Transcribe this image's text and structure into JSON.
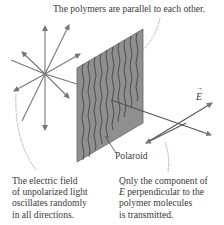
{
  "diagram": {
    "labels": {
      "top": "The polymers are parallel to each other.",
      "polaroid": "Polaroid",
      "field_vector": "E",
      "left_caption": [
        "The electric field",
        "of unpolarized light",
        "oscillates randomly",
        "in all directions."
      ],
      "right_caption": [
        "Only the component of",
        "perpendicular to the",
        "polymer molecules",
        "is transmitted."
      ],
      "right_caption_vector": "E"
    },
    "colors": {
      "polaroid_fill": "#8f8f8f",
      "polymer_lines": "#3c3c3c",
      "arrows": "#777777",
      "text": "#3a3a3a",
      "leader_lines": "#888888"
    },
    "elements": {
      "unpolarized_star": {
        "center": [
          45,
          74
        ],
        "arrow_count": 8
      },
      "polaroid_sheet": {
        "shape": "parallelogram",
        "corners": [
          [
            77,
            68
          ],
          [
            143,
            29
          ],
          [
            143,
            123
          ],
          [
            77,
            162
          ]
        ]
      },
      "transmitted_field": {
        "cross_center": [
          186,
          123
        ]
      }
    }
  }
}
